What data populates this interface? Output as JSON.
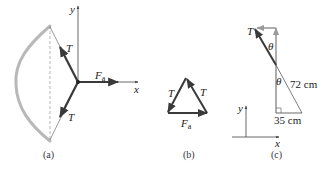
{
  "panels": {
    "a": {
      "caption": "(a)",
      "labels": {
        "y_axis": "y",
        "x_axis": "x",
        "tension_upper": "T",
        "tension_lower": "T",
        "force_main": "F",
        "force_sub": "a"
      }
    },
    "b": {
      "caption": "(b)",
      "labels": {
        "tension_left": "T",
        "tension_right": "T",
        "force_main": "F",
        "force_sub": "a"
      }
    },
    "c": {
      "caption": "(c)",
      "labels": {
        "tension": "T",
        "theta_upper": "θ",
        "theta_lower": "θ",
        "hypotenuse": "72 cm",
        "base": "35 cm",
        "y_axis": "y",
        "x_axis": "x"
      }
    }
  },
  "colors": {
    "vector": "#3a3a3a",
    "bow": "#b8b8b8",
    "gray_component": "#9a9a9a",
    "axis": "#444444"
  }
}
